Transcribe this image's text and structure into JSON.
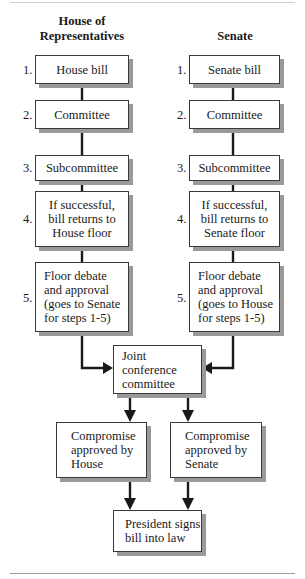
{
  "headings": {
    "house": "House of\nRepresentatives",
    "senate": "Senate"
  },
  "house_steps": [
    {
      "num": "1.",
      "label": "House bill"
    },
    {
      "num": "2.",
      "label": "Committee"
    },
    {
      "num": "3.",
      "label": "Subcommittee"
    },
    {
      "num": "4.",
      "label": "If successful,\nbill returns to\nHouse floor"
    },
    {
      "num": "5.",
      "label": "Floor debate\nand approval\n(goes to Senate\nfor steps 1-5)"
    }
  ],
  "senate_steps": [
    {
      "num": "1.",
      "label": "Senate bill"
    },
    {
      "num": "2.",
      "label": "Committee"
    },
    {
      "num": "3.",
      "label": "Subcommittee"
    },
    {
      "num": "4.",
      "label": "If successful,\nbill returns to\nSenate floor"
    },
    {
      "num": "5.",
      "label": "Floor debate\nand approval\n(goes to House\nfor steps 1-5)"
    }
  ],
  "joint": {
    "label": "Joint conference\ncommittee"
  },
  "compromise": {
    "house": "Compromise\napproved by\nHouse",
    "senate": "Compromise\napproved by\nSenate"
  },
  "final": {
    "label": "President signs\nbill into law"
  },
  "colors": {
    "line": "#1a1a1a",
    "shadow": "#9a9a9a",
    "border": "#3a3a3a"
  }
}
